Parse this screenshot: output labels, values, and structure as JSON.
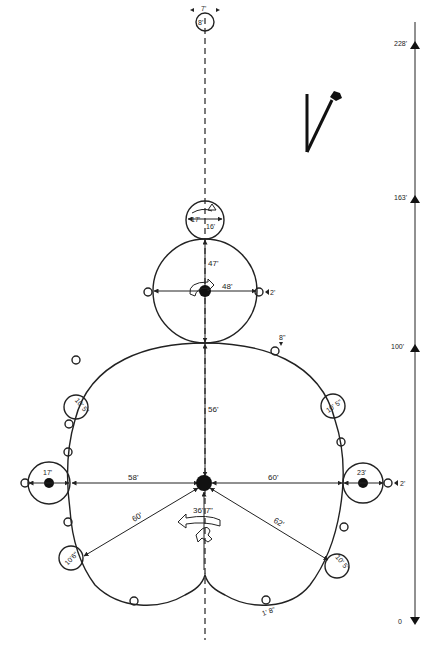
{
  "diagram": {
    "type": "rotor-figure-plan",
    "north_arrow": {
      "glyph": "N",
      "label": ""
    },
    "scale_bar": {
      "ticks": [
        "0",
        "100'",
        "163'",
        "228'"
      ]
    },
    "axis": {
      "top_circle_small": {
        "width_label": "7'",
        "height_label": "8'"
      },
      "head_circle": {
        "width_label": "17'",
        "height_label": "16'"
      },
      "upper_body_circle": {
        "vertical_label": "47'",
        "horizontal_label": "48'",
        "side_marker_label": "2'"
      },
      "main_body": {
        "vertical_label": "56'",
        "left_label": "58'",
        "right_label": "60'",
        "lower_left_label": "60'",
        "lower_right_label": "62'",
        "bottom_vertical_label": "36' 7\"",
        "top_right_marker_label": "8\"",
        "bottom_marker_label": "1' 8\""
      },
      "left_hand_circle": {
        "label": "17'"
      },
      "right_hand_circle": {
        "label": "23'",
        "side_marker_label": "2'"
      },
      "upper_left_small_circle": {
        "label": "10' 5\""
      },
      "upper_right_small_circle": {
        "label": "10' 5\""
      },
      "lower_left_small_circle": {
        "label": "10'6\""
      },
      "lower_right_small_circle": {
        "label": "10' 5\""
      }
    }
  }
}
